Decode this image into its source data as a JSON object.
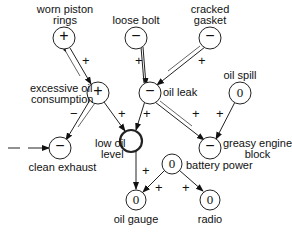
{
  "nodes": {
    "worn_piston_rings": {
      "label1": "worn piston",
      "label2": "rings",
      "sign": "+"
    },
    "loose_bolt": {
      "label": "loose bolt",
      "sign": "−"
    },
    "cracked_gasket": {
      "label1": "cracked",
      "label2": "gasket",
      "sign": "−"
    },
    "excessive_oil_consumption": {
      "label1": "excessive oil",
      "label2": "consumption",
      "sign": "+"
    },
    "oil_leak": {
      "label": "oil leak",
      "sign": "−"
    },
    "oil_spill": {
      "label": "oil spill",
      "sign": "0"
    },
    "clean_exhaust": {
      "label": "clean exhaust",
      "sign": "−"
    },
    "low_oil_level": {
      "label1": "low oil",
      "label2": "level",
      "sign": ""
    },
    "greasy_engine_block": {
      "label1": "greasy engine",
      "label2": "block",
      "sign": "−"
    },
    "battery_power": {
      "label": "battery power",
      "sign": "0"
    },
    "oil_gauge": {
      "label": "oil gauge",
      "sign": "0"
    },
    "radio": {
      "label": "radio",
      "sign": "0"
    }
  },
  "edges": {
    "wpr_eoc": "+",
    "lb_ol": "+",
    "cg_ol": "+",
    "eoc_ce": "−",
    "eoc_lol": "+",
    "ol_lol": "+",
    "ol_geb": "+",
    "os_geb": "+",
    "lol_og": "+",
    "bp_og": "+",
    "bp_radio": "+",
    "input_ce": "−"
  }
}
